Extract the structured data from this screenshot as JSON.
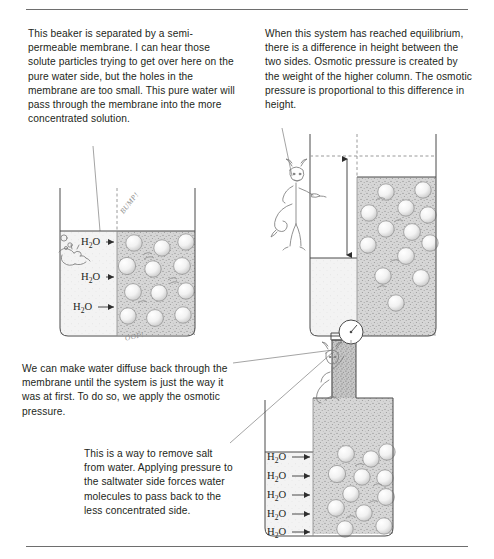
{
  "page": {
    "top_rule": true,
    "bottom_rule": true
  },
  "panels": {
    "intro": {
      "text": "This beaker is separated by a semi-permeable membrane. I can hear those solute particles trying to get over here on the pure water side, but the holes in the membrane are too small. This pure water will pass through the membrane into the more concentrated solution."
    },
    "equilibrium": {
      "text": "When this system has reached equilibrium, there is a difference in height between the two sides. Osmotic pressure is created by the weight of the higher column. The osmotic pressure is proportional to this difference in height."
    },
    "reverse": {
      "text": "We can make water diffuse back through the membrane until the system is just the way it was at first. To do so, we apply the osmotic pressure."
    },
    "desalination": {
      "text": "This is a way to remove salt from water. Applying pressure to the saltwater side forces water molecules to pass back to the less concentrated side."
    }
  },
  "figures": {
    "beaker_one": {
      "name": "beaker-semipermeable-membrane",
      "water_labels": [
        "H2O",
        "H2O",
        "H2O"
      ],
      "sound_effects": [
        "BUMP!",
        "OOF!"
      ],
      "membrane": "dashed-vertical-line",
      "left_side": "pure water",
      "right_side": "concentrated solution"
    },
    "beaker_two": {
      "name": "beaker-at-equilibrium",
      "height_difference_arrow": "double-headed-vertical-arrow",
      "dashed_level_line": true,
      "character": "imp-pointing"
    },
    "beaker_three": {
      "name": "beaker-reverse-osmosis",
      "water_labels": [
        "H2O",
        "H2O",
        "H2O",
        "H2O",
        "H2O"
      ],
      "gauge": "pressure-gauge-dial",
      "piston": "plunger-applying-pressure",
      "character": "imp-pushing-piston"
    }
  },
  "colors": {
    "ink": "#4a4a4a",
    "text": "#231f20",
    "rule": "#6e6e6e",
    "leader": "#8d8d8d",
    "solution_fill": "#cfcfcf",
    "water_fill": "#f0f0f0"
  },
  "labels": {
    "h2o_html": "H<sub>2</sub>O"
  }
}
